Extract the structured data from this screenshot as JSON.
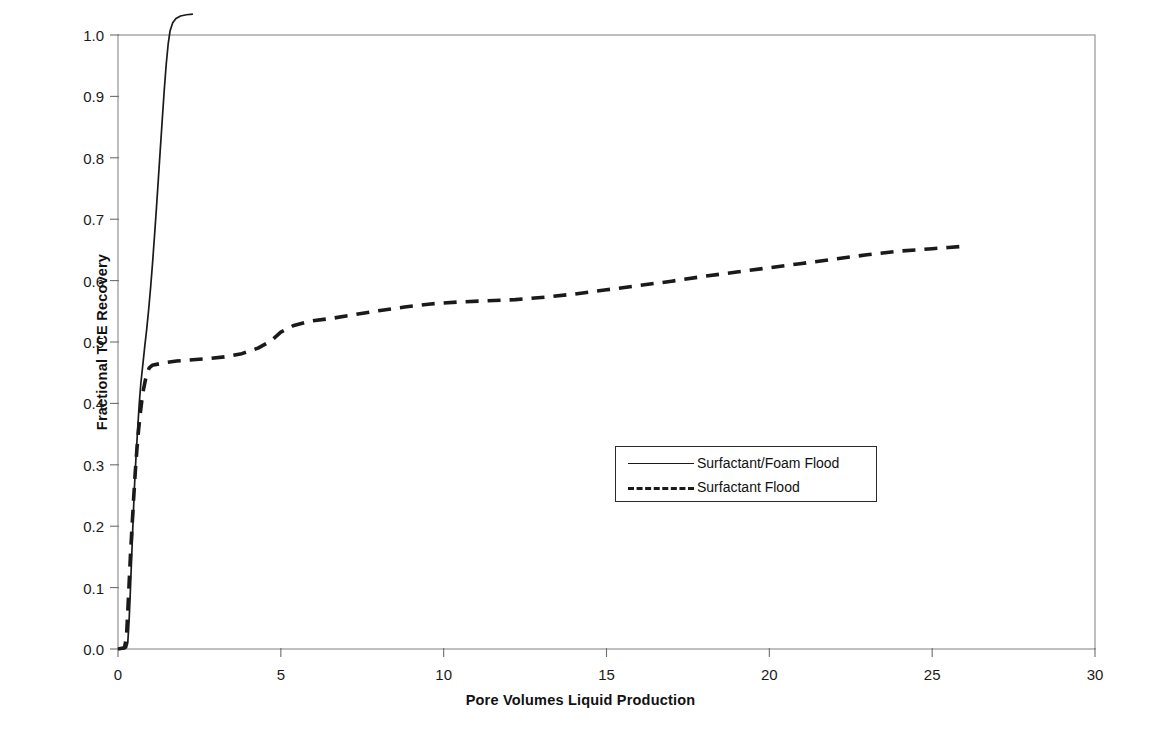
{
  "chart_data": {
    "type": "line",
    "title": "",
    "xlabel": "Pore Volumes Liquid Production",
    "ylabel": "Fractional TCE Recovery",
    "xlim": [
      0,
      30
    ],
    "ylim": [
      0.0,
      1.0
    ],
    "xticks": [
      "0",
      "5",
      "10",
      "15",
      "20",
      "25",
      "30"
    ],
    "xtick_values": [
      0,
      5,
      10,
      15,
      20,
      25,
      30
    ],
    "yticks": [
      "0.0",
      "0.1",
      "0.2",
      "0.3",
      "0.4",
      "0.5",
      "0.6",
      "0.7",
      "0.8",
      "0.9",
      "1.0"
    ],
    "ytick_values": [
      0.0,
      0.1,
      0.2,
      0.3,
      0.4,
      0.5,
      0.6,
      0.7,
      0.8,
      0.9,
      1.0
    ],
    "grid": false,
    "legend_position": "center",
    "series": [
      {
        "name": "Surfactant/Foam Flood",
        "style": "solid",
        "color": "#1a1a1a",
        "points": [
          [
            0.0,
            0.0
          ],
          [
            0.18,
            0.0
          ],
          [
            0.26,
            0.002
          ],
          [
            0.3,
            0.01
          ],
          [
            0.34,
            0.045
          ],
          [
            0.38,
            0.095
          ],
          [
            0.42,
            0.15
          ],
          [
            0.46,
            0.205
          ],
          [
            0.5,
            0.258
          ],
          [
            0.55,
            0.31
          ],
          [
            0.6,
            0.355
          ],
          [
            0.65,
            0.398
          ],
          [
            0.7,
            0.432
          ],
          [
            0.76,
            0.462
          ],
          [
            0.82,
            0.492
          ],
          [
            0.88,
            0.52
          ],
          [
            0.94,
            0.552
          ],
          [
            1.0,
            0.588
          ],
          [
            1.06,
            0.628
          ],
          [
            1.12,
            0.672
          ],
          [
            1.18,
            0.718
          ],
          [
            1.24,
            0.766
          ],
          [
            1.3,
            0.815
          ],
          [
            1.36,
            0.863
          ],
          [
            1.42,
            0.91
          ],
          [
            1.48,
            0.952
          ],
          [
            1.54,
            0.985
          ],
          [
            1.6,
            1.007
          ],
          [
            1.68,
            1.02
          ],
          [
            1.78,
            1.027
          ],
          [
            1.92,
            1.031
          ],
          [
            2.1,
            1.033
          ],
          [
            2.3,
            1.034
          ]
        ]
      },
      {
        "name": "Surfactant Flood",
        "style": "dashed",
        "color": "#1a1a1a",
        "points": [
          [
            0.0,
            0.0
          ],
          [
            0.2,
            0.002
          ],
          [
            0.26,
            0.02
          ],
          [
            0.3,
            0.06
          ],
          [
            0.34,
            0.105
          ],
          [
            0.38,
            0.15
          ],
          [
            0.43,
            0.198
          ],
          [
            0.48,
            0.245
          ],
          [
            0.53,
            0.288
          ],
          [
            0.58,
            0.325
          ],
          [
            0.63,
            0.356
          ],
          [
            0.68,
            0.382
          ],
          [
            0.73,
            0.404
          ],
          [
            0.78,
            0.422
          ],
          [
            0.84,
            0.438
          ],
          [
            0.9,
            0.45
          ],
          [
            0.96,
            0.458
          ],
          [
            1.05,
            0.462
          ],
          [
            1.4,
            0.466
          ],
          [
            1.8,
            0.469
          ],
          [
            2.3,
            0.471
          ],
          [
            2.8,
            0.473
          ],
          [
            3.3,
            0.476
          ],
          [
            3.8,
            0.481
          ],
          [
            4.3,
            0.49
          ],
          [
            4.7,
            0.502
          ],
          [
            5.0,
            0.516
          ],
          [
            5.4,
            0.527
          ],
          [
            5.9,
            0.534
          ],
          [
            6.5,
            0.538
          ],
          [
            7.2,
            0.544
          ],
          [
            8.0,
            0.551
          ],
          [
            8.8,
            0.557
          ],
          [
            9.6,
            0.562
          ],
          [
            10.4,
            0.565
          ],
          [
            11.3,
            0.567
          ],
          [
            12.2,
            0.569
          ],
          [
            13.1,
            0.573
          ],
          [
            14.0,
            0.578
          ],
          [
            15.0,
            0.585
          ],
          [
            16.0,
            0.592
          ],
          [
            17.0,
            0.599
          ],
          [
            18.0,
            0.607
          ],
          [
            19.0,
            0.614
          ],
          [
            20.0,
            0.621
          ],
          [
            21.0,
            0.628
          ],
          [
            22.0,
            0.635
          ],
          [
            23.0,
            0.642
          ],
          [
            24.0,
            0.648
          ],
          [
            25.0,
            0.652
          ],
          [
            25.5,
            0.654
          ],
          [
            26.0,
            0.656
          ]
        ]
      }
    ],
    "legend": [
      {
        "label": "Surfactant/Foam Flood",
        "style": "solid"
      },
      {
        "label": "Surfactant Flood",
        "style": "dashed"
      }
    ]
  }
}
